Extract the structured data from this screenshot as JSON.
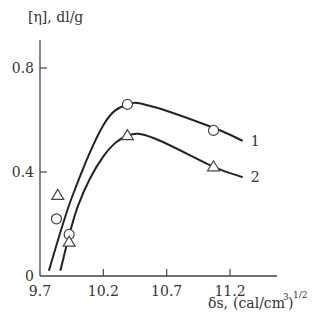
{
  "chart_data": {
    "type": "line",
    "title": "",
    "ylabel": "[η], dl/g",
    "xlabel": "δs, (cal/cm³)^1/2",
    "xlabel_parts": {
      "symbol": "δs,",
      "unit": "(cal/cm",
      "exp3": "3",
      "close": ")",
      "exp": "1/2"
    },
    "xlim": [
      9.7,
      11.5
    ],
    "ylim": [
      0,
      0.9
    ],
    "x_ticks": [
      9.7,
      10.2,
      10.7,
      11.2
    ],
    "x_tick_labels": [
      "9.7",
      "10.2",
      "10.7",
      "11.2"
    ],
    "y_ticks": [
      0,
      0.4,
      0.8
    ],
    "y_tick_labels": [
      "0",
      "0.4",
      "0.8"
    ],
    "grid": false,
    "legend": "inline curve labels at right end",
    "series": [
      {
        "name": "1",
        "marker": "circle",
        "points": [
          {
            "x": 9.83,
            "y": 0.22
          },
          {
            "x": 9.93,
            "y": 0.16
          },
          {
            "x": 10.39,
            "y": 0.66
          },
          {
            "x": 11.07,
            "y": 0.56
          }
        ],
        "curve": [
          {
            "x": 9.77,
            "y": 0.02
          },
          {
            "x": 9.95,
            "y": 0.3
          },
          {
            "x": 10.2,
            "y": 0.58
          },
          {
            "x": 10.39,
            "y": 0.66
          },
          {
            "x": 10.6,
            "y": 0.65
          },
          {
            "x": 11.07,
            "y": 0.57
          },
          {
            "x": 11.3,
            "y": 0.52
          }
        ]
      },
      {
        "name": "2",
        "marker": "triangle",
        "points": [
          {
            "x": 9.84,
            "y": 0.31
          },
          {
            "x": 9.93,
            "y": 0.13
          },
          {
            "x": 10.39,
            "y": 0.54
          },
          {
            "x": 11.07,
            "y": 0.42
          }
        ],
        "curve": [
          {
            "x": 9.86,
            "y": 0.02
          },
          {
            "x": 10.0,
            "y": 0.27
          },
          {
            "x": 10.2,
            "y": 0.46
          },
          {
            "x": 10.39,
            "y": 0.54
          },
          {
            "x": 10.6,
            "y": 0.53
          },
          {
            "x": 11.07,
            "y": 0.42
          },
          {
            "x": 11.3,
            "y": 0.38
          }
        ]
      }
    ]
  }
}
